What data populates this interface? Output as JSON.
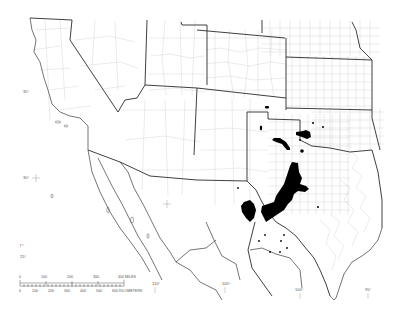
{
  "map": {
    "title": "",
    "region": "Southwestern United States and northern Mexico",
    "colors": {
      "background": "#ffffff",
      "state_border": "#2a2a2a",
      "county_border": "#bdbdbd",
      "coastline": "#3a3a3a",
      "range_fill": "#000000"
    },
    "latitude_labels": [
      {
        "text": "35°",
        "x": 23,
        "y": 92
      },
      {
        "text": "30°",
        "x": 23,
        "y": 178
      },
      {
        "text": "25°",
        "x": 20,
        "y": 257
      }
    ],
    "longitude_labels": [
      {
        "text": "110°",
        "x": 152,
        "y": 284
      },
      {
        "text": "105°",
        "x": 223,
        "y": 284
      },
      {
        "text": "100°",
        "x": 296,
        "y": 290
      },
      {
        "text": "95°",
        "x": 365,
        "y": 290
      }
    ],
    "small_marker_label": {
      "text": "Γ°",
      "x": 20,
      "y": 245
    },
    "scale_bar": {
      "miles": {
        "ticks": [
          "0",
          "100",
          "200",
          "300",
          "400 MILES"
        ]
      },
      "kilometers": {
        "ticks": [
          "0",
          "100",
          "200",
          "300",
          "400",
          "500",
          "600 KILOMETERS"
        ]
      }
    },
    "range_legend": {
      "solid_area": "Primary range (central Texas)",
      "dots": "Isolated occurrence records"
    }
  }
}
